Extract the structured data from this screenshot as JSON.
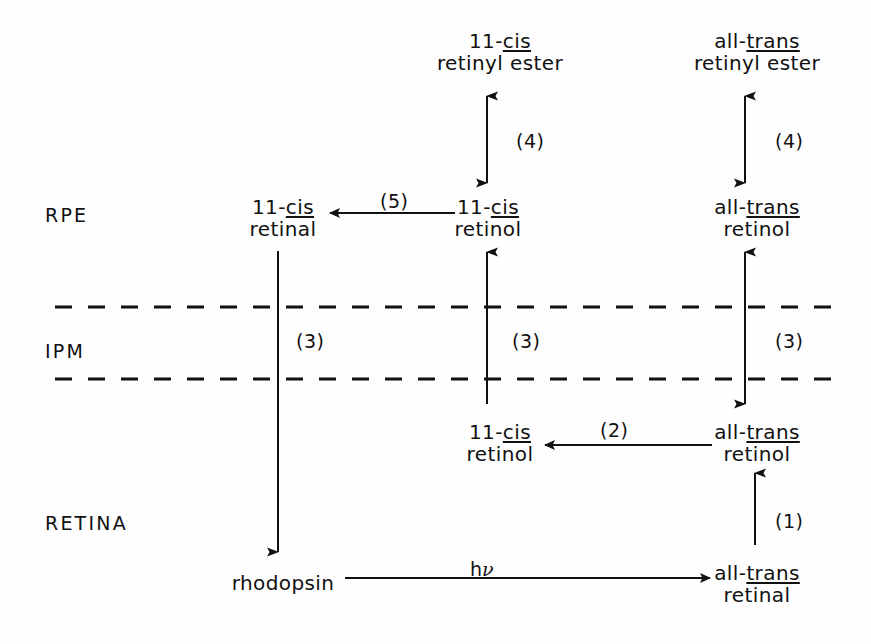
{
  "figure": {
    "background": "#fefefe",
    "ink": "#111111"
  },
  "zones": [
    {
      "id": "rpe",
      "label": "RPE",
      "x": 45,
      "y": 204
    },
    {
      "id": "ipm",
      "label": "IPM",
      "x": 45,
      "y": 340
    },
    {
      "id": "retina",
      "label": "RETINA",
      "x": 45,
      "y": 512
    }
  ],
  "membranes": [
    {
      "id": "rpe-ipm-boundary",
      "y": 307
    },
    {
      "id": "ipm-retina-boundary",
      "y": 379
    }
  ],
  "nodes": [
    {
      "id": "cis-retinyl-ester",
      "prefix": "11-",
      "prefix_em": "cis",
      "line2": "retinyl ester",
      "line2_underlined": false,
      "x": 500,
      "y": 30
    },
    {
      "id": "trans-retinyl-ester",
      "prefix": "all-",
      "prefix_em": "trans",
      "line2": "retinyl ester",
      "line2_underlined": false,
      "x": 757,
      "y": 30
    },
    {
      "id": "cis-retinal-rpe",
      "prefix": "11-",
      "prefix_em": "cis",
      "line2": "retinal",
      "line2_underlined": false,
      "x": 283,
      "y": 196
    },
    {
      "id": "cis-retinol-rpe",
      "prefix": "11-",
      "prefix_em": "cis",
      "line2": "retinol",
      "line2_underlined": false,
      "x": 488,
      "y": 196
    },
    {
      "id": "trans-retinol-rpe",
      "prefix": "all-",
      "prefix_em": "trans",
      "line2": "retinol",
      "line2_underlined": false,
      "x": 757,
      "y": 196
    },
    {
      "id": "cis-retinol-ipm",
      "prefix": "11-",
      "prefix_em": "cis",
      "line2": "retinol",
      "line2_underlined": false,
      "x": 500,
      "y": 421
    },
    {
      "id": "trans-retinol-ipm",
      "prefix": "all-",
      "prefix_em": "trans",
      "line2": "retinol",
      "line2_underlined": false,
      "x": 757,
      "y": 421
    },
    {
      "id": "trans-retinal-retina",
      "prefix": "all-",
      "prefix_em": "trans",
      "line2": "retinal",
      "line2_underlined": false,
      "x": 757,
      "y": 562
    }
  ],
  "simple_nodes": [
    {
      "id": "rhodopsin",
      "label": "rhodopsin",
      "x": 283,
      "y": 572
    }
  ],
  "step_labels": [
    {
      "id": "step-4-cis",
      "text": "(4)",
      "x": 516,
      "y": 130
    },
    {
      "id": "step-4-trans",
      "text": "(4)",
      "x": 775,
      "y": 130
    },
    {
      "id": "step-5",
      "text": "(5)",
      "x": 380,
      "y": 190
    },
    {
      "id": "step-3-left",
      "text": "(3)",
      "x": 296,
      "y": 330
    },
    {
      "id": "step-3-middle",
      "text": "(3)",
      "x": 512,
      "y": 330
    },
    {
      "id": "step-3-right",
      "text": "(3)",
      "x": 775,
      "y": 330
    },
    {
      "id": "step-2",
      "text": "(2)",
      "x": 600,
      "y": 419
    },
    {
      "id": "step-1",
      "text": "(1)",
      "x": 775,
      "y": 510
    }
  ],
  "photon_label": {
    "id": "photon",
    "prefix": "h",
    "symbol": "ν",
    "x": 470,
    "y": 558
  },
  "arrows": [
    {
      "id": "arrow-4-cis",
      "kind": "vertical-double",
      "x": 487,
      "y1": 96,
      "y2": 183
    },
    {
      "id": "arrow-4-trans",
      "kind": "vertical-double",
      "x": 745,
      "y1": 96,
      "y2": 183
    },
    {
      "id": "arrow-5",
      "kind": "horizontal-left",
      "y": 213,
      "x1": 455,
      "x2": 330
    },
    {
      "id": "arrow-3-left",
      "kind": "vertical-down",
      "x": 278,
      "y1": 251,
      "y2": 552
    },
    {
      "id": "arrow-3-middle",
      "kind": "vertical-up",
      "x": 487,
      "y1": 404,
      "y2": 252
    },
    {
      "id": "arrow-3-right",
      "kind": "vertical-double",
      "x": 745,
      "y1": 252,
      "y2": 404
    },
    {
      "id": "arrow-2",
      "kind": "horizontal-left",
      "y": 445,
      "x1": 712,
      "x2": 545
    },
    {
      "id": "arrow-1",
      "kind": "vertical-up",
      "x": 755,
      "y1": 545,
      "y2": 473
    },
    {
      "id": "arrow-hv",
      "kind": "horizontal-right",
      "y": 578,
      "x1": 345,
      "x2": 710
    }
  ]
}
